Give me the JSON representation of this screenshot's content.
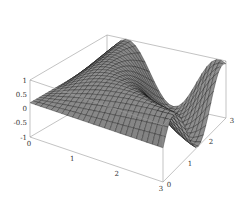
{
  "chart_data": {
    "type": "surface3d",
    "title": "",
    "xlabel": "",
    "ylabel": "",
    "zlabel": "",
    "x_range": [
      0,
      3
    ],
    "y_range": [
      0,
      3
    ],
    "z_range": [
      -1,
      1
    ],
    "x_ticks": [
      "0",
      "1",
      "2",
      "3"
    ],
    "y_ticks": [
      "0",
      "1",
      "2",
      "3"
    ],
    "z_ticks": [
      "-1",
      "-0.5",
      "0",
      "0.5",
      "1"
    ],
    "function_description": "smooth surface with two ridges/peaks near z=1 and a trough near z=-1; values roughly z = sin(x*y)-like",
    "grid_resolution": 25,
    "boxed": true,
    "shading": "gray"
  },
  "colors": {
    "surface_light": "#d8d8d8",
    "surface_dark": "#2a2a2a",
    "mesh": "#111111",
    "box": "#9a9a9a"
  }
}
